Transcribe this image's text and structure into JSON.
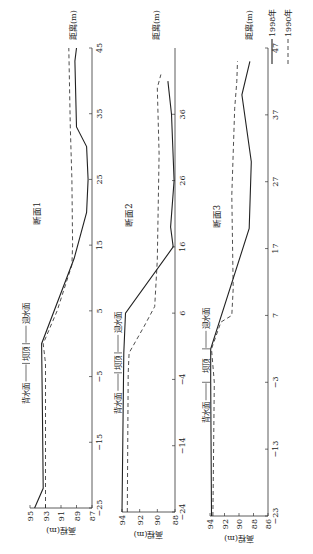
{
  "legend": {
    "items": [
      {
        "label": "1990年",
        "style": "dashed"
      },
      {
        "label": "1998年",
        "style": "solid"
      }
    ]
  },
  "colors": {
    "line": "#222222",
    "axis": "#333333",
    "background": "#ffffff"
  },
  "annotations": {
    "back": "背水面",
    "crest": "坝顶",
    "front": "迎水面"
  },
  "chart_data": [
    {
      "type": "line",
      "title": "断面1",
      "xlabel": "距离(m)",
      "ylabel": "高程(m)",
      "xlim": [
        -25,
        45
      ],
      "ylim": [
        87,
        95
      ],
      "xticks": [
        -25,
        -15,
        -5,
        5,
        15,
        25,
        35,
        45
      ],
      "yticks": [
        87,
        89,
        91,
        93,
        95
      ],
      "crest": [
        -3,
        0
      ],
      "series": [
        {
          "name": "1990年",
          "style": "dashed",
          "points": [
            [
              -25,
              93
            ],
            [
              -3,
              93
            ],
            [
              0,
              93.3
            ],
            [
              5,
              91.5
            ],
            [
              12,
              89.6
            ],
            [
              15,
              89.5
            ],
            [
              25,
              89.6
            ],
            [
              33,
              89.8
            ],
            [
              45,
              90.0
            ]
          ]
        },
        {
          "name": "1998年",
          "style": "solid",
          "points": [
            [
              -25,
              94.4
            ],
            [
              -22,
              93.3
            ],
            [
              -10,
              93.4
            ],
            [
              0,
              93.5
            ],
            [
              13,
              89.3
            ],
            [
              20,
              87.7
            ],
            [
              25,
              87.5
            ],
            [
              30,
              87.7
            ],
            [
              33,
              89.0
            ],
            [
              43,
              89.2
            ],
            [
              45,
              89.0
            ]
          ]
        }
      ]
    },
    {
      "type": "line",
      "title": "断面2",
      "xlabel": "距离(m)",
      "ylabel": "高程(m)",
      "xlim": [
        -24,
        46
      ],
      "ylim": [
        88,
        94
      ],
      "xticks": [
        -24,
        -14,
        -4,
        6,
        16,
        26,
        36
      ],
      "yticks": [
        88,
        90,
        92,
        94
      ],
      "crest": [
        -3,
        0
      ],
      "series": [
        {
          "name": "1990年",
          "style": "dashed",
          "points": [
            [
              -24,
              93.4
            ],
            [
              -3,
              93.3
            ],
            [
              0,
              93.2
            ],
            [
              4,
              91.5
            ],
            [
              7,
              90.3
            ],
            [
              14,
              90.0
            ],
            [
              30,
              89.8
            ],
            [
              40,
              90.0
            ],
            [
              42,
              89.6
            ]
          ]
        },
        {
          "name": "1998年",
          "style": "solid",
          "points": [
            [
              -24,
              94
            ],
            [
              0,
              93.8
            ],
            [
              6,
              93.6
            ],
            [
              16,
              88.2
            ],
            [
              19,
              88.5
            ],
            [
              26,
              88.1
            ],
            [
              36,
              88.4
            ],
            [
              41,
              88.8
            ]
          ]
        }
      ]
    },
    {
      "type": "line",
      "title": "断面3",
      "xlabel": "距离(m)",
      "ylabel": "高程(m)",
      "xlim": [
        -23,
        47
      ],
      "ylim": [
        86,
        94
      ],
      "xticks": [
        -23,
        -13,
        -3,
        7,
        17,
        27,
        37,
        47
      ],
      "yticks": [
        86,
        88,
        90,
        92,
        94
      ],
      "crest": [
        -3,
        2
      ],
      "series": [
        {
          "name": "1990年",
          "style": "dashed",
          "points": [
            [
              -23,
              93.6
            ],
            [
              -3,
              93.4
            ],
            [
              2,
              93.8
            ],
            [
              6,
              92.5
            ],
            [
              7,
              91.0
            ],
            [
              11,
              90.8
            ],
            [
              25,
              91.0
            ],
            [
              38,
              90.6
            ],
            [
              42,
              90.3
            ],
            [
              45,
              90.2
            ]
          ]
        },
        {
          "name": "1998年",
          "style": "solid",
          "points": [
            [
              -23,
              93.8
            ],
            [
              -3,
              93.9
            ],
            [
              2,
              93.9
            ],
            [
              20,
              88.6
            ],
            [
              30,
              88.3
            ],
            [
              40,
              89.6
            ],
            [
              45,
              88.5
            ]
          ]
        }
      ]
    }
  ]
}
